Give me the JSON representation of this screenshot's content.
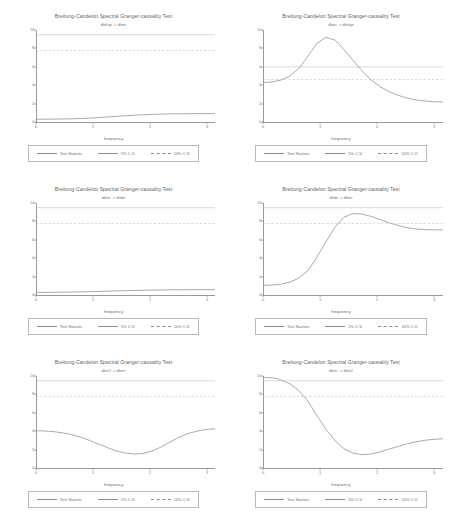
{
  "common": {
    "title": "Breitung-Candelon Spectral Granger-causality Test",
    "xlabel": "frequency",
    "legend": {
      "statistic": "Test Statistic",
      "cv5": "5% C.V.",
      "cv10": "10% C.V."
    },
    "xticks": [
      "0",
      "1",
      "2",
      "3"
    ]
  },
  "colors": {
    "line": "#7d7d7d",
    "critical": "#b5b5b5",
    "axis": "#9a9a9a",
    "text": "#6e6e6e",
    "background": "#ffffff"
  },
  "chart_data": [
    {
      "type": "line",
      "panel": "top-left",
      "title": "Breitung-Candelon Spectral Granger-causality Test",
      "subtitle": "dlnfspi -> dlner",
      "xlabel": "frequency",
      "ylabel": "",
      "xlim": [
        0,
        3.14
      ],
      "ylim": [
        0,
        10
      ],
      "xticks": [
        0,
        1,
        2,
        3
      ],
      "yticks": [
        0,
        2,
        4,
        6,
        8,
        10
      ],
      "ytick_labels": [
        "0",
        "2",
        "4",
        "6",
        "8",
        "10"
      ],
      "grid": false,
      "legend_position": "bottom",
      "series": [
        {
          "name": "Test Statistic",
          "style": "solid",
          "x": [
            0,
            0.26,
            0.52,
            0.79,
            1.05,
            1.31,
            1.57,
            1.83,
            2.09,
            2.36,
            2.62,
            2.88,
            3.14
          ],
          "values": [
            0.3,
            0.31,
            0.33,
            0.38,
            0.46,
            0.57,
            0.68,
            0.77,
            0.84,
            0.88,
            0.9,
            0.91,
            0.91
          ]
        },
        {
          "name": "5% C.V.",
          "style": "solid-light",
          "constant": 9.49
        },
        {
          "name": "10% C.V.",
          "style": "dashed",
          "constant": 7.78
        }
      ]
    },
    {
      "type": "line",
      "panel": "top-right",
      "title": "Breitung-Candelon Spectral Granger-causality Test",
      "subtitle": "dlner -> dlnfspi",
      "xlabel": "frequency",
      "ylabel": "",
      "xlim": [
        0,
        3.14
      ],
      "ylim": [
        0,
        10
      ],
      "xticks": [
        0,
        1,
        2,
        3
      ],
      "yticks": [
        0,
        2,
        4,
        6,
        8,
        10
      ],
      "ytick_labels": [
        "0",
        "2",
        "4",
        "6",
        "8",
        "10"
      ],
      "grid": false,
      "legend_position": "bottom",
      "series": [
        {
          "name": "Test Statistic",
          "style": "solid",
          "x": [
            0,
            0.16,
            0.31,
            0.47,
            0.63,
            0.79,
            0.94,
            1.1,
            1.26,
            1.41,
            1.57,
            1.73,
            1.88,
            2.04,
            2.2,
            2.36,
            2.51,
            2.67,
            2.83,
            2.98,
            3.14
          ],
          "values": [
            4.3,
            4.35,
            4.55,
            5.0,
            5.85,
            7.2,
            8.55,
            9.2,
            8.9,
            7.9,
            6.7,
            5.55,
            4.6,
            3.85,
            3.3,
            2.9,
            2.6,
            2.4,
            2.28,
            2.2,
            2.18
          ]
        },
        {
          "name": "5% C.V.",
          "style": "solid-light",
          "constant": 5.99
        },
        {
          "name": "10% C.V.",
          "style": "dashed",
          "constant": 4.61
        }
      ]
    },
    {
      "type": "line",
      "panel": "middle-left",
      "title": "Breitung-Candelon Spectral Granger-causality Test",
      "subtitle": "dlner -> dlnbr",
      "xlabel": "frequency",
      "ylabel": "",
      "xlim": [
        0,
        3.14
      ],
      "ylim": [
        0,
        10
      ],
      "xticks": [
        0,
        1,
        2,
        3
      ],
      "yticks": [
        0,
        2,
        4,
        6,
        8,
        10
      ],
      "ytick_labels": [
        "0",
        "2",
        "4",
        "6",
        "8",
        "10"
      ],
      "grid": false,
      "legend_position": "bottom",
      "series": [
        {
          "name": "Test Statistic",
          "style": "solid",
          "x": [
            0,
            0.26,
            0.52,
            0.79,
            1.05,
            1.31,
            1.57,
            1.83,
            2.09,
            2.36,
            2.62,
            2.88,
            3.14
          ],
          "values": [
            0.28,
            0.29,
            0.31,
            0.34,
            0.38,
            0.43,
            0.47,
            0.51,
            0.54,
            0.56,
            0.58,
            0.58,
            0.58
          ]
        },
        {
          "name": "5% C.V.",
          "style": "solid-light",
          "constant": 9.49
        },
        {
          "name": "10% C.V.",
          "style": "dashed",
          "constant": 7.78
        }
      ]
    },
    {
      "type": "line",
      "panel": "middle-right",
      "title": "Breitung-Candelon Spectral Granger-causality Test",
      "subtitle": "dlnbr -> dlner",
      "xlabel": "frequency",
      "ylabel": "",
      "xlim": [
        0,
        3.14
      ],
      "ylim": [
        0,
        10
      ],
      "xticks": [
        0,
        1,
        2,
        3
      ],
      "yticks": [
        0,
        2,
        4,
        6,
        8,
        10
      ],
      "ytick_labels": [
        "0",
        "2",
        "4",
        "6",
        "8",
        "10"
      ],
      "grid": false,
      "legend_position": "bottom",
      "series": [
        {
          "name": "Test Statistic",
          "style": "solid",
          "x": [
            0,
            0.16,
            0.31,
            0.47,
            0.63,
            0.79,
            0.94,
            1.1,
            1.26,
            1.41,
            1.57,
            1.73,
            1.88,
            2.04,
            2.2,
            2.36,
            2.51,
            2.67,
            2.83,
            2.98,
            3.14
          ],
          "values": [
            1.05,
            1.08,
            1.18,
            1.4,
            1.85,
            2.7,
            4.1,
            5.8,
            7.4,
            8.45,
            8.85,
            8.8,
            8.55,
            8.2,
            7.85,
            7.55,
            7.32,
            7.18,
            7.1,
            7.08,
            7.08
          ]
        },
        {
          "name": "5% C.V.",
          "style": "solid-light",
          "constant": 9.49
        },
        {
          "name": "10% C.V.",
          "style": "dashed",
          "constant": 7.78
        }
      ]
    },
    {
      "type": "line",
      "panel": "bottom-left",
      "title": "Breitung-Candelon Spectral Granger-causality Test",
      "subtitle": "dlnir2 -> dlner",
      "xlabel": "frequency",
      "ylabel": "",
      "xlim": [
        0,
        3.14
      ],
      "ylim": [
        0,
        10
      ],
      "xticks": [
        0,
        1,
        2,
        3
      ],
      "yticks": [
        0,
        2,
        4,
        6,
        8,
        10
      ],
      "ytick_labels": [
        "0",
        "2",
        "4",
        "6",
        "8",
        "10"
      ],
      "grid": false,
      "legend_position": "bottom",
      "series": [
        {
          "name": "Test Statistic",
          "style": "solid",
          "x": [
            0,
            0.16,
            0.31,
            0.47,
            0.63,
            0.79,
            0.94,
            1.1,
            1.26,
            1.41,
            1.57,
            1.73,
            1.88,
            2.04,
            2.2,
            2.36,
            2.51,
            2.67,
            2.83,
            2.98,
            3.14
          ],
          "values": [
            4.05,
            4.02,
            3.95,
            3.82,
            3.62,
            3.35,
            3.0,
            2.6,
            2.2,
            1.85,
            1.62,
            1.52,
            1.58,
            1.85,
            2.3,
            2.85,
            3.35,
            3.75,
            4.02,
            4.18,
            4.25
          ]
        },
        {
          "name": "5% C.V.",
          "style": "solid-light",
          "constant": 9.49
        },
        {
          "name": "10% C.V.",
          "style": "dashed",
          "constant": 7.78
        }
      ]
    },
    {
      "type": "line",
      "panel": "bottom-right",
      "title": "Breitung-Candelon Spectral Granger-causality Test",
      "subtitle": "dlner -> dlnir2",
      "xlabel": "frequency",
      "ylabel": "",
      "xlim": [
        0,
        3.14
      ],
      "ylim": [
        0,
        10
      ],
      "xticks": [
        0,
        1,
        2,
        3
      ],
      "yticks": [
        0,
        2,
        4,
        6,
        8,
        10
      ],
      "ytick_labels": [
        "0",
        "2",
        "4",
        "6",
        "8",
        "10"
      ],
      "grid": false,
      "legend_position": "bottom",
      "series": [
        {
          "name": "Test Statistic",
          "style": "solid",
          "x": [
            0,
            0.16,
            0.31,
            0.47,
            0.63,
            0.79,
            0.94,
            1.1,
            1.26,
            1.41,
            1.57,
            1.73,
            1.88,
            2.04,
            2.2,
            2.36,
            2.51,
            2.67,
            2.83,
            2.98,
            3.14
          ],
          "values": [
            9.85,
            9.8,
            9.6,
            9.15,
            8.4,
            7.2,
            5.7,
            4.2,
            2.95,
            2.1,
            1.62,
            1.45,
            1.52,
            1.75,
            2.05,
            2.35,
            2.62,
            2.85,
            3.02,
            3.12,
            3.18
          ]
        },
        {
          "name": "5% C.V.",
          "style": "solid-light",
          "constant": 9.49
        },
        {
          "name": "10% C.V.",
          "style": "dashed",
          "constant": 7.78
        }
      ]
    }
  ]
}
